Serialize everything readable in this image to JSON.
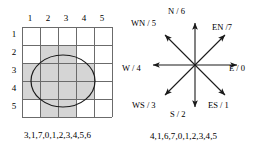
{
  "figure": {
    "grid_panel": {
      "column_headers": [
        "1",
        "2",
        "3",
        "4",
        "5"
      ],
      "row_headers": [
        "1",
        "2",
        "3",
        "4",
        "5"
      ],
      "caption": "3,1,7,0,1,2,3,4,5,6",
      "shaded_cells": [
        {
          "row": 2,
          "col": 2
        },
        {
          "row": 2,
          "col": 3
        },
        {
          "row": 3,
          "col": 1
        },
        {
          "row": 3,
          "col": 2
        },
        {
          "row": 3,
          "col": 3
        },
        {
          "row": 3,
          "col": 4
        },
        {
          "row": 4,
          "col": 1
        },
        {
          "row": 4,
          "col": 2
        },
        {
          "row": 4,
          "col": 3
        },
        {
          "row": 4,
          "col": 4
        },
        {
          "row": 5,
          "col": 2
        },
        {
          "row": 5,
          "col": 3
        }
      ],
      "shape": "ellipse"
    },
    "compass_panel": {
      "caption": "4,1,6,7,0,1,2,3,4,5",
      "directions": [
        {
          "label": "E / 0",
          "code": "0",
          "name": "east",
          "angle": 0
        },
        {
          "label": "ES / 1",
          "code": "1",
          "name": "east-south",
          "angle": 315
        },
        {
          "label": "S / 2",
          "code": "2",
          "name": "south",
          "angle": 270
        },
        {
          "label": "WS / 3",
          "code": "3",
          "name": "west-south",
          "angle": 225
        },
        {
          "label": "W / 4",
          "code": "4",
          "name": "west",
          "angle": 180
        },
        {
          "label": "WN / 5",
          "code": "5",
          "name": "west-north",
          "angle": 135
        },
        {
          "label": "N / 6",
          "code": "6",
          "name": "north",
          "angle": 90
        },
        {
          "label": "EN /7",
          "code": "7",
          "name": "east-north",
          "angle": 45
        }
      ]
    },
    "colors": {
      "shade": "#d5d5d5",
      "line": "#6b6b6b",
      "stroke": "#1a1a1a",
      "background": "#ffffff"
    }
  }
}
